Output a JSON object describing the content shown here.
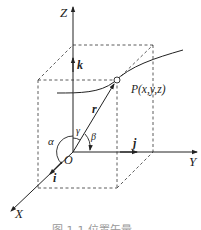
{
  "diagram": {
    "type": "3d-coordinate-system",
    "axes": {
      "z_label": "Z",
      "y_label": "Y",
      "x_label": "X",
      "origin_label": "O"
    },
    "unit_vectors": {
      "i": "i",
      "j": "j",
      "k": "k"
    },
    "position_vector": "r",
    "point_label": "P(x,y,z)",
    "angles": {
      "alpha": "α",
      "beta": "β",
      "gamma": "γ"
    },
    "caption": "图 1-1  位置矢量"
  }
}
